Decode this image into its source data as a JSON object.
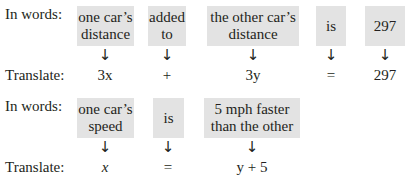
{
  "labels": {
    "in_words": "In words:",
    "translate": "Translate:"
  },
  "arrow_glyph": "↓",
  "equation1": {
    "words": [
      "one car’s distance",
      "added to",
      "the other car’s distance",
      "is",
      "297"
    ],
    "translation": [
      "3x",
      "+",
      "3y",
      "=",
      "297"
    ]
  },
  "equation2": {
    "words": [
      "one car’s speed",
      "is",
      "5 mph faster than the other"
    ],
    "translation": [
      "x",
      "=",
      "y + 5"
    ]
  },
  "colors": {
    "box_fill": "#e3e3e3",
    "text": "#231f20"
  }
}
